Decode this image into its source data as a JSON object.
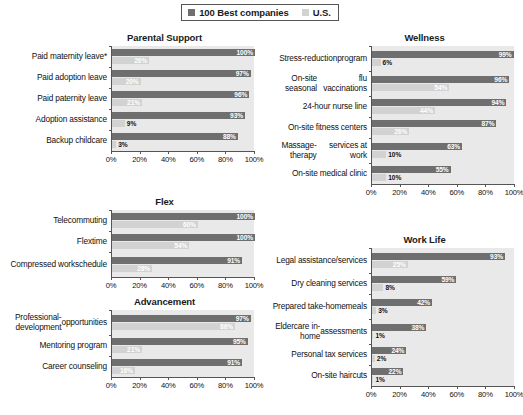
{
  "legend": {
    "entries": [
      {
        "label": "100 Best companies",
        "color": "#6f6f6f",
        "icon": "square-swatch-dark"
      },
      {
        "label": "U.S.",
        "color": "#d2d2d2",
        "icon": "square-swatch-light"
      }
    ]
  },
  "axis": {
    "ticks": [
      "0%",
      "20%",
      "40%",
      "60%",
      "80%",
      "100%"
    ],
    "min": 0,
    "max": 100
  },
  "chart_data": [
    {
      "type": "bar",
      "title": "Parental Support",
      "orientation": "horizontal",
      "xlabel": "",
      "ylabel": "",
      "xlim": [
        0,
        100
      ],
      "grid": false,
      "legend_position": "top-center",
      "categories": [
        "Paid maternity leave*",
        "Paid adoption leave",
        "Paid paternity leave",
        "Adoption assistance",
        "Backup childcare"
      ],
      "series": [
        {
          "name": "100 Best companies",
          "values": [
            100,
            97,
            96,
            93,
            88
          ]
        },
        {
          "name": "U.S.",
          "values": [
            26,
            20,
            21,
            9,
            3
          ]
        }
      ]
    },
    {
      "type": "bar",
      "title": "Wellness",
      "orientation": "horizontal",
      "xlabel": "",
      "ylabel": "",
      "xlim": [
        0,
        100
      ],
      "grid": false,
      "legend_position": "top-center",
      "categories": [
        "Stress-reduction program",
        "On-site seasonal flu vaccinations",
        "24-hour nurse line",
        "On-site fitness centers",
        "Massage-therapy services at work",
        "On-site medical clinic"
      ],
      "series": [
        {
          "name": "100 Best companies",
          "values": [
            99,
            96,
            94,
            87,
            63,
            55
          ]
        },
        {
          "name": "U.S.",
          "values": [
            6,
            54,
            44,
            26,
            10,
            10
          ]
        }
      ]
    },
    {
      "type": "bar",
      "title": "Flex",
      "orientation": "horizontal",
      "xlabel": "",
      "ylabel": "",
      "xlim": [
        0,
        100
      ],
      "grid": false,
      "legend_position": "top-center",
      "categories": [
        "Telecommuting",
        "Flextime",
        "Compressed work schedule"
      ],
      "series": [
        {
          "name": "100 Best companies",
          "values": [
            100,
            100,
            91
          ]
        },
        {
          "name": "U.S.",
          "values": [
            60,
            54,
            28
          ]
        }
      ]
    },
    {
      "type": "bar",
      "title": "Work Life",
      "orientation": "horizontal",
      "xlabel": "",
      "ylabel": "",
      "xlim": [
        0,
        100
      ],
      "grid": false,
      "legend_position": "top-center",
      "categories": [
        "Legal assistance/ services",
        "Dry cleaning services",
        "Prepared take-home meals",
        "Eldercare in-home assessments",
        "Personal tax services",
        "On-site haircuts"
      ],
      "series": [
        {
          "name": "100 Best companies",
          "values": [
            93,
            59,
            42,
            38,
            24,
            22
          ]
        },
        {
          "name": "U.S.",
          "values": [
            25,
            8,
            3,
            1,
            2,
            1
          ]
        }
      ]
    },
    {
      "type": "bar",
      "title": "Advancement",
      "orientation": "horizontal",
      "xlabel": "",
      "ylabel": "",
      "xlim": [
        0,
        100
      ],
      "grid": false,
      "legend_position": "top-center",
      "categories": [
        "Professional-development opportunities",
        "Mentoring program",
        "Career counseling"
      ],
      "series": [
        {
          "name": "100 Best companies",
          "values": [
            97,
            95,
            91
          ]
        },
        {
          "name": "U.S.",
          "values": [
            86,
            21,
            16
          ]
        }
      ]
    }
  ],
  "panels": [
    {
      "key": "parental_support",
      "title": "Parental Support",
      "rows": [
        {
          "label": "Paid maternity leave*",
          "lines": [
            "Paid maternity leave*"
          ],
          "best": 100,
          "best_label": "100%",
          "us": 26,
          "us_label": "26%"
        },
        {
          "label": "Paid adoption leave",
          "lines": [
            "Paid adoption leave"
          ],
          "best": 97,
          "best_label": "97%",
          "us": 20,
          "us_label": "20%"
        },
        {
          "label": "Paid paternity leave",
          "lines": [
            "Paid paternity leave"
          ],
          "best": 96,
          "best_label": "96%",
          "us": 21,
          "us_label": "21%"
        },
        {
          "label": "Adoption assistance",
          "lines": [
            "Adoption assistance"
          ],
          "best": 93,
          "best_label": "93%",
          "us": 9,
          "us_label": "9%"
        },
        {
          "label": "Backup childcare",
          "lines": [
            "Backup childcare"
          ],
          "best": 88,
          "best_label": "88%",
          "us": 3,
          "us_label": "3%"
        }
      ]
    },
    {
      "key": "wellness",
      "title": "Wellness",
      "rows": [
        {
          "label": "Stress-reduction program",
          "lines": [
            "Stress-reduction",
            "program"
          ],
          "best": 99,
          "best_label": "99%",
          "us": 6,
          "us_label": "6%"
        },
        {
          "label": "On-site seasonal flu vaccinations",
          "lines": [
            "On-site seasonal",
            "flu vaccinations"
          ],
          "best": 96,
          "best_label": "96%",
          "us": 54,
          "us_label": "54%"
        },
        {
          "label": "24-hour nurse line",
          "lines": [
            "24-hour nurse line"
          ],
          "best": 94,
          "best_label": "94%",
          "us": 44,
          "us_label": "44%"
        },
        {
          "label": "On-site fitness centers",
          "lines": [
            "On-site fitness centers"
          ],
          "best": 87,
          "best_label": "87%",
          "us": 26,
          "us_label": "26%"
        },
        {
          "label": "Massage-therapy services at work",
          "lines": [
            "Massage-therapy",
            "services at work"
          ],
          "best": 63,
          "best_label": "63%",
          "us": 10,
          "us_label": "10%"
        },
        {
          "label": "On-site medical clinic",
          "lines": [
            "On-site medical clinic"
          ],
          "best": 55,
          "best_label": "55%",
          "us": 10,
          "us_label": "10%"
        }
      ]
    },
    {
      "key": "flex",
      "title": "Flex",
      "rows": [
        {
          "label": "Telecommuting",
          "lines": [
            "Telecommuting"
          ],
          "best": 100,
          "best_label": "100%",
          "us": 60,
          "us_label": "60%"
        },
        {
          "label": "Flextime",
          "lines": [
            "Flextime"
          ],
          "best": 100,
          "best_label": "100%",
          "us": 54,
          "us_label": "54%"
        },
        {
          "label": "Compressed work schedule",
          "lines": [
            "Compressed work",
            "schedule"
          ],
          "best": 91,
          "best_label": "91%",
          "us": 28,
          "us_label": "28%"
        }
      ]
    },
    {
      "key": "work_life",
      "title": "Work Life",
      "rows": [
        {
          "label": "Legal assistance/ services",
          "lines": [
            "Legal assistance/",
            "services"
          ],
          "best": 93,
          "best_label": "93%",
          "us": 25,
          "us_label": "25%"
        },
        {
          "label": "Dry cleaning services",
          "lines": [
            "Dry cleaning services"
          ],
          "best": 59,
          "best_label": "59%",
          "us": 8,
          "us_label": "8%"
        },
        {
          "label": "Prepared take-home meals",
          "lines": [
            "Prepared take-home",
            "meals"
          ],
          "best": 42,
          "best_label": "42%",
          "us": 3,
          "us_label": "3%"
        },
        {
          "label": "Eldercare in-home assessments",
          "lines": [
            "Eldercare in-home",
            "assessments"
          ],
          "best": 38,
          "best_label": "38%",
          "us": 1,
          "us_label": "1%"
        },
        {
          "label": "Personal tax services",
          "lines": [
            "Personal tax services"
          ],
          "best": 24,
          "best_label": "24%",
          "us": 2,
          "us_label": "2%"
        },
        {
          "label": "On-site haircuts",
          "lines": [
            "On-site haircuts"
          ],
          "best": 22,
          "best_label": "22%",
          "us": 1,
          "us_label": "1%"
        }
      ]
    },
    {
      "key": "advancement",
      "title": "Advancement",
      "rows": [
        {
          "label": "Professional-development opportunities",
          "lines": [
            "Professional-development",
            "opportunities"
          ],
          "best": 97,
          "best_label": "97%",
          "us": 86,
          "us_label": "86%"
        },
        {
          "label": "Mentoring program",
          "lines": [
            "Mentoring program"
          ],
          "best": 95,
          "best_label": "95%",
          "us": 21,
          "us_label": "21%"
        },
        {
          "label": "Career counseling",
          "lines": [
            "Career counseling"
          ],
          "best": 91,
          "best_label": "91%",
          "us": 16,
          "us_label": "16%"
        }
      ]
    }
  ]
}
